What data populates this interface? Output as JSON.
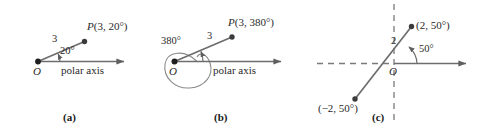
{
  "figure": {
    "stroke_color": "#6d6d6d",
    "dash_color": "#7a7a7a",
    "text_color": "#2a2a2a",
    "background": "#ffffff"
  },
  "panels": [
    {
      "id": "a",
      "caption": "(a)",
      "origin_label": "O",
      "axis_label": "polar axis",
      "radius_label": "3",
      "angle_label": "20°",
      "point_label_p": "P",
      "point_label_coords": "(3, 20°)",
      "point_r": 3,
      "point_theta_deg": 20,
      "loop": false
    },
    {
      "id": "b",
      "caption": "(b)",
      "origin_label": "O",
      "axis_label": "polar axis",
      "radius_label": "3",
      "angle_label": "380°",
      "point_label_p": "P",
      "point_label_coords": "(3, 380°)",
      "point_r": 3,
      "point_theta_deg": 380,
      "loop": true
    },
    {
      "id": "c",
      "caption": "(c)",
      "origin_label": "O",
      "radius_label": "2",
      "angle_label": "50°",
      "point_upper_label": "(2, 50°)",
      "point_lower_label": "(−2, 50°)",
      "point_upper_r": 2,
      "point_lower_r": -2,
      "point_theta_deg": 50,
      "axes_style": "dashed-cross-with-polar-arrow"
    }
  ]
}
